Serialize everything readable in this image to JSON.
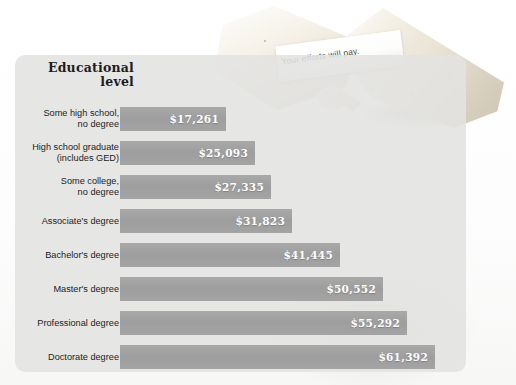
{
  "photo": {
    "fortune_text": "Your efforts will pay.",
    "cookie_right_name": "fortune-cookie-right",
    "cookie_left_name": "fortune-cookie-left"
  },
  "chart_data": {
    "type": "bar",
    "orientation": "horizontal",
    "title": "Educational\nlevel",
    "title_line1": "Educational",
    "title_line2": "level",
    "xlabel": "",
    "ylabel": "Educational level",
    "grid": false,
    "legend": "none",
    "value_prefix": "$",
    "categories": [
      "Some high school,\nno degree",
      "High school graduate\n(includes GED)",
      "Some college,\nno degree",
      "Associate's degree",
      "Bachelor's degree",
      "Master's degree",
      "Professional degree",
      "Doctorate degree"
    ],
    "values": [
      17261,
      25093,
      27335,
      31823,
      41445,
      50552,
      55292,
      61392
    ],
    "value_labels": [
      "$17,261",
      "$25,093",
      "$27,335",
      "$31,823",
      "$41,445",
      "$50,552",
      "$55,292",
      "$61,392"
    ],
    "xlim": [
      0,
      61392
    ],
    "bars": [
      {
        "label_line1": "Some high school,",
        "label_line2": "no degree",
        "value": 17261,
        "value_label": "$17,261",
        "width_px": 106
      },
      {
        "label_line1": "High school graduate",
        "label_line2": "(includes GED)",
        "value": 25093,
        "value_label": "$25,093",
        "width_px": 135
      },
      {
        "label_line1": "Some college,",
        "label_line2": "no degree",
        "value": 27335,
        "value_label": "$27,335",
        "width_px": 151
      },
      {
        "label_line1": "Associate's degree",
        "label_line2": "",
        "value": 31823,
        "value_label": "$31,823",
        "width_px": 172
      },
      {
        "label_line1": "Bachelor's degree",
        "label_line2": "",
        "value": 41445,
        "value_label": "$41,445",
        "width_px": 220
      },
      {
        "label_line1": "Master's degree",
        "label_line2": "",
        "value": 50552,
        "value_label": "$50,552",
        "width_px": 263
      },
      {
        "label_line1": "Professional degree",
        "label_line2": "",
        "value": 55292,
        "value_label": "$55,292",
        "width_px": 287
      },
      {
        "label_line1": "Doctorate degree",
        "label_line2": "",
        "value": 61392,
        "value_label": "$61,392",
        "width_px": 315
      }
    ]
  },
  "colors": {
    "bar_fill": "#a1a1a1",
    "panel_bg": "#e2e2e1",
    "value_text": "#ffffff",
    "label_text": "#1c1c1c",
    "title_text": "#1d1d1d",
    "page_bg": "#ffffff"
  }
}
